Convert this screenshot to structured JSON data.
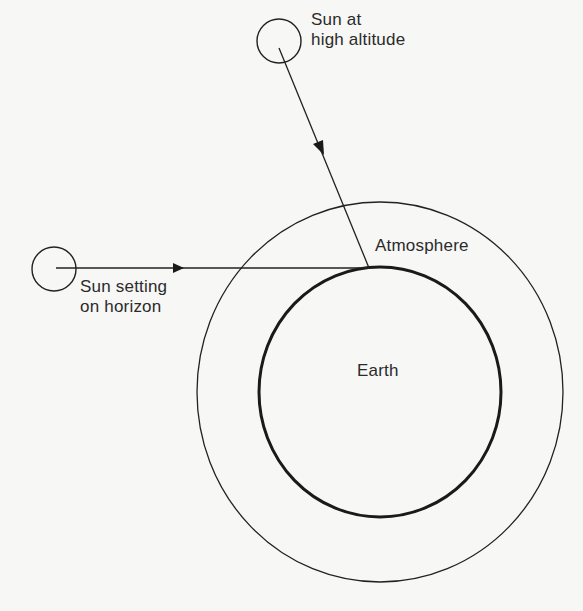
{
  "diagram": {
    "title": "",
    "colors": {
      "background": "#f7f7f5",
      "stroke": "#222222",
      "text": "#2b2b2b"
    },
    "labels": {
      "sun_high": {
        "line1": "Sun at",
        "line2": "high altitude"
      },
      "sun_horizon": {
        "line1": "Sun setting",
        "line2": "on horizon"
      },
      "atmosphere": "Atmosphere",
      "earth": "Earth"
    },
    "nodes": [
      {
        "id": "sun_high",
        "shape": "circle",
        "label": "Sun at high altitude"
      },
      {
        "id": "sun_horizon",
        "shape": "circle",
        "label": "Sun setting on horizon"
      },
      {
        "id": "atmosphere",
        "shape": "circle",
        "label": "Atmosphere"
      },
      {
        "id": "earth",
        "shape": "circle",
        "label": "Earth"
      }
    ],
    "edges": [
      {
        "from": "sun_high",
        "to": "earth",
        "type": "arrow",
        "description": "short path of sunlight through atmosphere"
      },
      {
        "from": "sun_horizon",
        "to": "earth",
        "type": "arrow",
        "description": "long path of sunlight through atmosphere"
      }
    ]
  }
}
